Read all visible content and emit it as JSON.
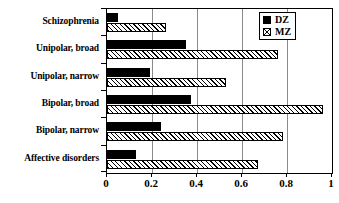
{
  "chart_data": {
    "type": "bar",
    "orientation": "horizontal",
    "title": "",
    "xlabel": "",
    "ylabel": "",
    "categories": [
      "Schizophrenia",
      "Unipolar, broad",
      "Unipolar, narrow",
      "Bipolar, broad",
      "Bipolar, narrow",
      "Affective disorders"
    ],
    "series": [
      {
        "name": "DZ",
        "values": [
          0.05,
          0.35,
          0.19,
          0.375,
          0.24,
          0.13
        ]
      },
      {
        "name": "MZ",
        "values": [
          0.26,
          0.76,
          0.53,
          0.96,
          0.78,
          0.67
        ]
      }
    ],
    "xlim": [
      0,
      1
    ],
    "xticks": [
      0,
      0.2,
      0.4,
      0.6,
      0.8,
      1
    ],
    "xtick_labels": [
      "0",
      "0.2",
      "0.4",
      "0.6",
      "0.8",
      "1"
    ],
    "grid": "vertical",
    "legend": {
      "position": "top-right",
      "entries": [
        {
          "label": "DZ",
          "swatch": "solid-black"
        },
        {
          "label": "MZ",
          "swatch": "diagonal-hatch"
        }
      ]
    },
    "colors": {
      "dz": "#000000",
      "mz": "#ffffff",
      "axis": "#000000",
      "gridline": "#8a8a8a",
      "background": "#ffffff"
    }
  }
}
